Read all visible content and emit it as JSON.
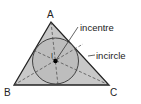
{
  "diagram": {
    "vertices": {
      "A": {
        "label": "A",
        "x": 51,
        "y": 22
      },
      "B": {
        "label": "B",
        "x": 14,
        "y": 85
      },
      "C": {
        "label": "C",
        "x": 109,
        "y": 85
      }
    },
    "incentre": {
      "x": 55.5,
      "y": 61,
      "radius": 23
    },
    "annotations": {
      "incentre_label": "incentre",
      "incircle_label": "incircle",
      "incentre_marker": "I"
    },
    "colors": {
      "triangle_fill": "#c8c8c8",
      "circle_fill": "#bdbdbd",
      "stroke": "#222222"
    }
  }
}
